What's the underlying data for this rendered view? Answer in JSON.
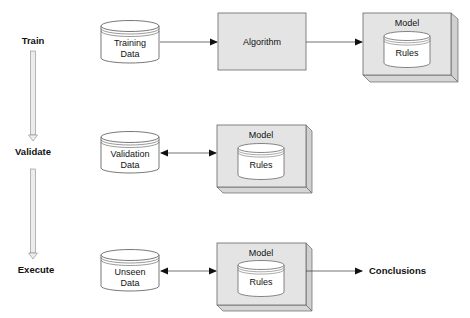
{
  "stages": [
    {
      "label": "Train"
    },
    {
      "label": "Validate"
    },
    {
      "label": "Execute"
    }
  ],
  "train_row": {
    "data_store": {
      "line1": "Training",
      "line2": "Data"
    },
    "process": {
      "label": "Algorithm"
    },
    "model": {
      "title": "Model",
      "inner": "Rules"
    }
  },
  "validate_row": {
    "data_store": {
      "line1": "Validation",
      "line2": "Data"
    },
    "model": {
      "title": "Model",
      "inner": "Rules"
    }
  },
  "execute_row": {
    "data_store": {
      "line1": "Unseen",
      "line2": "Data"
    },
    "model": {
      "title": "Model",
      "inner": "Rules"
    },
    "output": {
      "label": "Conclusions"
    }
  },
  "colors": {
    "box_fill": "#e4e4e4",
    "box_side": "#d2d2d2",
    "cylinder_fill": "#ffffff",
    "stroke": "#555555",
    "arrow_shaft": "#e8e8e8"
  }
}
